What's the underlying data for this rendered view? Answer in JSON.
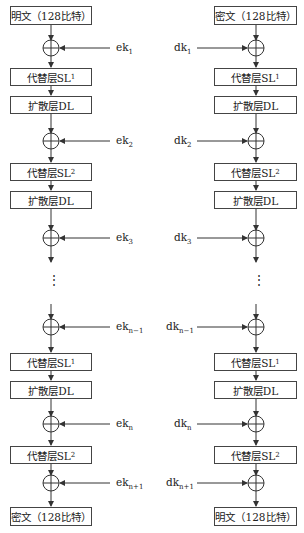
{
  "left": {
    "title": "encryption",
    "input": "明文（128比特）",
    "output": "密文（128比特）",
    "blocks": [
      {
        "label": "代替层SL",
        "sub": "1",
        "y": 68
      },
      {
        "label": "扩散层DL",
        "sub": "",
        "y": 96
      },
      {
        "label": "代替层SL",
        "sub": "2",
        "y": 163
      },
      {
        "label": "扩散层DL",
        "sub": "",
        "y": 191
      },
      {
        "label": "代替层SL",
        "sub": "1",
        "y": 353
      },
      {
        "label": "扩散层DL",
        "sub": "",
        "y": 381
      },
      {
        "label": "代替层SL",
        "sub": "2",
        "y": 446
      }
    ],
    "keys": [
      {
        "base": "ek",
        "sub": "1",
        "y": 48
      },
      {
        "base": "ek",
        "sub": "2",
        "y": 141
      },
      {
        "base": "ek",
        "sub": "3",
        "y": 238
      },
      {
        "base": "ek",
        "sub": "n−1",
        "y": 327
      },
      {
        "base": "ek",
        "sub": "n",
        "y": 424
      },
      {
        "base": "ek",
        "sub": "n+1",
        "y": 483
      }
    ]
  },
  "right": {
    "title": "decryption",
    "input": "密文（128比特）",
    "output": "明文（128比特）",
    "blocks": [
      {
        "label": "代替层SL",
        "sub": "1",
        "y": 68
      },
      {
        "label": "扩散层DL",
        "sub": "",
        "y": 96
      },
      {
        "label": "代替层SL",
        "sub": "2",
        "y": 163
      },
      {
        "label": "扩散层DL",
        "sub": "",
        "y": 191
      },
      {
        "label": "代替层SL",
        "sub": "1",
        "y": 353
      },
      {
        "label": "扩散层DL",
        "sub": "",
        "y": 381
      },
      {
        "label": "代替层SL",
        "sub": "2",
        "y": 446
      }
    ],
    "keys": [
      {
        "base": "dk",
        "sub": "1",
        "y": 48
      },
      {
        "base": "dk",
        "sub": "2",
        "y": 141
      },
      {
        "base": "dk",
        "sub": "3",
        "y": 238
      },
      {
        "base": "dk",
        "sub": "n−1",
        "y": 327
      },
      {
        "base": "dk",
        "sub": "n",
        "y": 424
      },
      {
        "base": "dk",
        "sub": "n+1",
        "y": 483
      }
    ]
  },
  "ellipsis": "⋮",
  "xor_symbol": "xor-icon"
}
